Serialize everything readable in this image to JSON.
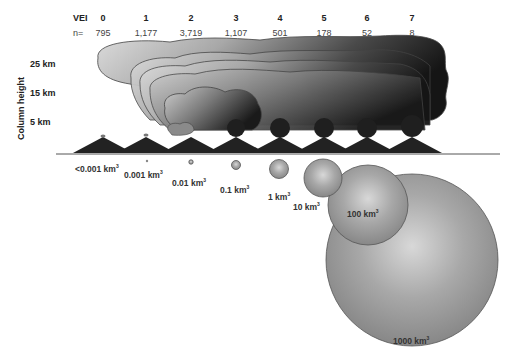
{
  "header": {
    "vei_label": "VEI",
    "n_label": "n=",
    "columns": [
      {
        "vei": "0",
        "n": "795"
      },
      {
        "vei": "1",
        "n": "1,177"
      },
      {
        "vei": "2",
        "n": "3,719"
      },
      {
        "vei": "3",
        "n": "1,107"
      },
      {
        "vei": "4",
        "n": "501"
      },
      {
        "vei": "5",
        "n": "178"
      },
      {
        "vei": "6",
        "n": "52"
      },
      {
        "vei": "7",
        "n": "8"
      }
    ]
  },
  "axis": {
    "title": "Column height",
    "ticks": [
      "25 km",
      "15 km",
      "5 km"
    ]
  },
  "volumes": [
    {
      "value": "<0.001 km",
      "unit_sup": "3"
    },
    {
      "value": "0.001 km",
      "unit_sup": "3"
    },
    {
      "value": "0.01 km",
      "unit_sup": "3"
    },
    {
      "value": "0.1 km",
      "unit_sup": "3"
    },
    {
      "value": "1 km",
      "unit_sup": "3"
    },
    {
      "value": "10 km",
      "unit_sup": "3"
    },
    {
      "value": "100 km",
      "unit_sup": "3"
    },
    {
      "value": "1000 km",
      "unit_sup": "3"
    }
  ],
  "colors": {
    "cloud_light": "#d4d4d4",
    "cloud_dark": "#1a1a1a",
    "volcano": "#222222",
    "sphere": "#9a9a9a",
    "ground_line": "#555555"
  }
}
